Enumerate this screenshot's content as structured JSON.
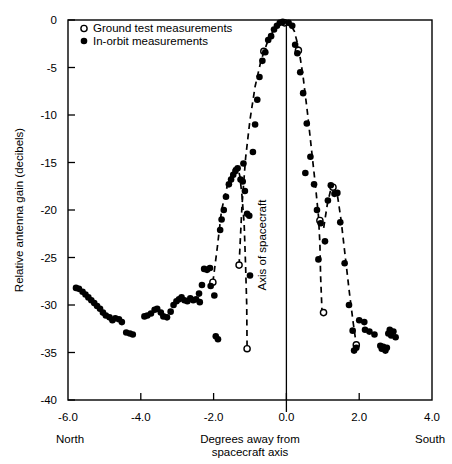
{
  "chart_data": {
    "type": "scatter",
    "title": "",
    "xlabel": "Degrees away from spacecraft axis",
    "ylabel": "Relative antenna gain (decibels)",
    "xlim": [
      -6.0,
      4.0
    ],
    "ylim": [
      -40,
      0
    ],
    "grid": false,
    "legend_position": "top-left inside plot",
    "x_ticks": [
      "-6.0",
      "-4.0",
      "-2.0",
      "0.0",
      "2.0",
      "4.0"
    ],
    "x_tick_values": [
      -6.0,
      -4.0,
      -2.0,
      0.0,
      2.0,
      4.0
    ],
    "y_ticks": [
      "0",
      "-5",
      "-10",
      "-15",
      "-20",
      "-25",
      "-30",
      "-35",
      "-40"
    ],
    "y_tick_values": [
      0,
      -5,
      -10,
      -15,
      -20,
      -25,
      -30,
      -35,
      -40
    ],
    "annotations": [
      {
        "name": "axis-of-spacecraft",
        "text": "Axis of spacecraft",
        "x": 0.0,
        "orientation": "vertical"
      },
      {
        "name": "north-label",
        "text": "North",
        "x": -6.0
      },
      {
        "name": "south-label",
        "text": "South",
        "x": 4.0
      }
    ],
    "series": [
      {
        "name": "Ground test measurements",
        "marker": "open-circle",
        "color": "#000000",
        "points": [
          [
            -2.02,
            -27.6
          ],
          [
            -1.3,
            -25.8
          ],
          [
            -1.08,
            -34.6
          ],
          [
            -0.62,
            -3.3
          ],
          [
            -0.05,
            -0.3
          ],
          [
            0.33,
            -3.2
          ],
          [
            0.92,
            -21.1
          ],
          [
            1.02,
            -30.8
          ],
          [
            1.28,
            -17.6
          ],
          [
            1.92,
            -34.2
          ]
        ]
      },
      {
        "name": "In-orbit measurements",
        "marker": "filled-circle",
        "color": "#000000",
        "points": [
          [
            -5.78,
            -28.2
          ],
          [
            -5.7,
            -28.3
          ],
          [
            -5.6,
            -28.6
          ],
          [
            -5.52,
            -28.9
          ],
          [
            -5.44,
            -29.2
          ],
          [
            -5.36,
            -29.5
          ],
          [
            -5.28,
            -29.8
          ],
          [
            -5.2,
            -30.1
          ],
          [
            -5.12,
            -30.4
          ],
          [
            -5.04,
            -30.8
          ],
          [
            -4.96,
            -31.1
          ],
          [
            -4.86,
            -31.3
          ],
          [
            -4.78,
            -31.6
          ],
          [
            -4.7,
            -31.4
          ],
          [
            -4.6,
            -31.5
          ],
          [
            -4.52,
            -31.8
          ],
          [
            -4.4,
            -32.9
          ],
          [
            -4.3,
            -33.0
          ],
          [
            -4.22,
            -33.1
          ],
          [
            -3.9,
            -31.2
          ],
          [
            -3.82,
            -31.1
          ],
          [
            -3.72,
            -30.9
          ],
          [
            -3.62,
            -30.5
          ],
          [
            -3.55,
            -30.4
          ],
          [
            -3.45,
            -30.8
          ],
          [
            -3.38,
            -31.2
          ],
          [
            -3.28,
            -31.3
          ],
          [
            -3.18,
            -30.7
          ],
          [
            -3.1,
            -30.0
          ],
          [
            -3.02,
            -29.6
          ],
          [
            -2.95,
            -29.4
          ],
          [
            -2.88,
            -29.2
          ],
          [
            -2.8,
            -29.5
          ],
          [
            -2.72,
            -29.6
          ],
          [
            -2.64,
            -29.3
          ],
          [
            -2.56,
            -29.5
          ],
          [
            -2.48,
            -29.4
          ],
          [
            -2.4,
            -28.8
          ],
          [
            -2.32,
            -27.9
          ],
          [
            -2.26,
            -26.2
          ],
          [
            -2.18,
            -26.3
          ],
          [
            -2.1,
            -26.1
          ],
          [
            -2.38,
            -29.7
          ],
          [
            -2.08,
            -28.0
          ],
          [
            -1.98,
            -29.0
          ],
          [
            -1.94,
            -33.3
          ],
          [
            -1.88,
            -33.6
          ],
          [
            -1.82,
            -22.1
          ],
          [
            -1.78,
            -21.0
          ],
          [
            -1.72,
            -20.0
          ],
          [
            -1.66,
            -18.6
          ],
          [
            -1.58,
            -17.3
          ],
          [
            -1.52,
            -16.8
          ],
          [
            -1.46,
            -16.3
          ],
          [
            -1.4,
            -15.9
          ],
          [
            -1.34,
            -15.6
          ],
          [
            -1.26,
            -16.8
          ],
          [
            -1.2,
            -17.0
          ],
          [
            -1.14,
            -18.0
          ],
          [
            -1.08,
            -20.4
          ],
          [
            -1.02,
            -20.6
          ],
          [
            -1.18,
            -15.1
          ],
          [
            -1.0,
            -26.9
          ],
          [
            -0.92,
            -13.9
          ],
          [
            -0.86,
            -11.0
          ],
          [
            -0.8,
            -8.4
          ],
          [
            -0.74,
            -6.0
          ],
          [
            -0.66,
            -4.3
          ],
          [
            -0.58,
            -3.4
          ],
          [
            -0.5,
            -2.1
          ],
          [
            -0.42,
            -1.7
          ],
          [
            -0.34,
            -1.0
          ],
          [
            -0.26,
            -0.6
          ],
          [
            -0.18,
            -0.3
          ],
          [
            -0.1,
            -0.2
          ],
          [
            0.06,
            -0.3
          ],
          [
            0.16,
            -0.6
          ],
          [
            0.24,
            -2.6
          ],
          [
            0.3,
            -3.5
          ],
          [
            0.38,
            -5.5
          ],
          [
            0.46,
            -7.7
          ],
          [
            0.56,
            -10.9
          ],
          [
            0.66,
            -14.4
          ],
          [
            0.76,
            -17.3
          ],
          [
            0.84,
            -20.0
          ],
          [
            0.94,
            -21.4
          ],
          [
            0.52,
            -16.1
          ],
          [
            0.88,
            -25.2
          ],
          [
            1.06,
            -23.3
          ],
          [
            1.14,
            -19.0
          ],
          [
            1.22,
            -17.4
          ],
          [
            1.32,
            -18.3
          ],
          [
            1.4,
            -18.2
          ],
          [
            1.48,
            -21.3
          ],
          [
            1.6,
            -25.6
          ],
          [
            1.72,
            -30.0
          ],
          [
            1.82,
            -32.7
          ],
          [
            1.92,
            -34.5
          ],
          [
            1.86,
            -34.8
          ],
          [
            2.0,
            -31.6
          ],
          [
            2.14,
            -31.8
          ],
          [
            2.16,
            -32.6
          ],
          [
            2.28,
            -32.8
          ],
          [
            2.42,
            -33.1
          ],
          [
            2.58,
            -34.3
          ],
          [
            2.62,
            -34.6
          ],
          [
            2.66,
            -34.4
          ],
          [
            2.72,
            -34.8
          ],
          [
            2.8,
            -33.0
          ],
          [
            2.84,
            -32.6
          ],
          [
            2.88,
            -33.2
          ],
          [
            2.94,
            -32.8
          ],
          [
            3.0,
            -33.4
          ],
          [
            2.76,
            -34.5
          ]
        ]
      }
    ],
    "fit_curve": {
      "name": "dashed-pattern-curve",
      "style": "dashed",
      "segments": [
        [
          [
            -2.02,
            -27.6
          ],
          [
            -1.9,
            -24.0
          ],
          [
            -1.78,
            -20.0
          ],
          [
            -1.62,
            -17.4
          ],
          [
            -1.44,
            -15.6
          ],
          [
            -1.34,
            -15.5
          ],
          [
            -1.28,
            -16.4
          ],
          [
            -1.22,
            -18.5
          ],
          [
            -1.16,
            -21.5
          ],
          [
            -1.12,
            -26.0
          ],
          [
            -1.09,
            -30.0
          ],
          [
            -1.08,
            -34.6
          ]
        ],
        [
          [
            -1.3,
            -25.8
          ],
          [
            -1.22,
            -19.5
          ],
          [
            -1.12,
            -14.5
          ],
          [
            -1.0,
            -10.5
          ],
          [
            -0.86,
            -7.0
          ],
          [
            -0.7,
            -4.3
          ],
          [
            -0.52,
            -2.3
          ],
          [
            -0.34,
            -1.0
          ],
          [
            -0.16,
            -0.3
          ],
          [
            -0.02,
            -0.2
          ],
          [
            0.1,
            -0.4
          ],
          [
            0.22,
            -1.2
          ],
          [
            0.34,
            -3.0
          ],
          [
            0.46,
            -6.0
          ],
          [
            0.58,
            -9.8
          ],
          [
            0.7,
            -14.0
          ],
          [
            0.8,
            -17.5
          ],
          [
            0.88,
            -20.6
          ],
          [
            0.92,
            -23.5
          ],
          [
            0.94,
            -27.0
          ],
          [
            0.98,
            -30.8
          ],
          [
            1.02,
            -30.8
          ]
        ],
        [
          [
            0.92,
            -21.1
          ],
          [
            1.02,
            -22.0
          ],
          [
            1.12,
            -19.5
          ],
          [
            1.22,
            -17.8
          ],
          [
            1.3,
            -17.6
          ],
          [
            1.4,
            -18.4
          ],
          [
            1.5,
            -21.0
          ],
          [
            1.62,
            -25.0
          ],
          [
            1.74,
            -29.0
          ],
          [
            1.84,
            -32.0
          ],
          [
            1.92,
            -34.2
          ]
        ]
      ]
    }
  },
  "legend": {
    "items": [
      {
        "marker": "open-circle",
        "label": "Ground test measurements"
      },
      {
        "marker": "filled-circle",
        "label": "In-orbit measurements"
      }
    ]
  },
  "axis_titles": {
    "y": "Relative antenna gain (decibels)",
    "x_line1": "Degrees away from",
    "x_line2": "spacecraft axis",
    "vertical_line": "Axis of spacecraft",
    "left_direction": "North",
    "right_direction": "South"
  }
}
